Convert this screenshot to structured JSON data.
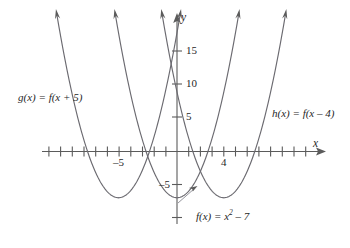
{
  "figure": {
    "type": "graph"
  },
  "axes": {
    "x_label": "x",
    "y_label": "y",
    "origin_px": [
      177,
      151.5
    ],
    "x_unit_px": 11.7,
    "y_unit_px": 6.6,
    "x_tick_labels": [
      {
        "value": -5,
        "text": "–5"
      },
      {
        "value": 4,
        "text": "4"
      }
    ],
    "y_tick_labels": [
      {
        "value": 15,
        "text": "15"
      },
      {
        "value": 10,
        "text": "10"
      },
      {
        "value": 5,
        "text": "5"
      },
      {
        "value": -5,
        "text": "–5"
      }
    ],
    "x_tick_values": [
      -11,
      -10,
      -9,
      -8,
      -7,
      -6,
      -5,
      -4,
      -3,
      -2,
      -1,
      1,
      2,
      3,
      4,
      5,
      6,
      7,
      8
    ],
    "y_tick_values": [
      15,
      10,
      5,
      -5,
      -10
    ]
  },
  "chart_data": {
    "type": "line",
    "title": "",
    "xlabel": "x",
    "ylabel": "y",
    "xlim": [
      -12.5,
      9.5
    ],
    "ylim": [
      -12,
      20
    ],
    "grid": false,
    "legend": "inline-annotations",
    "series": [
      {
        "name": "f(x) = x² – 7",
        "expression": "x^2-7",
        "vertex": [
          0,
          -7
        ],
        "x_range": [
          -5,
          5
        ]
      },
      {
        "name": "g(x) = f(x + 5)",
        "expression": "(x+5)^2-7",
        "vertex": [
          -5,
          -7
        ],
        "x_range": [
          -10,
          0
        ]
      },
      {
        "name": "h(x) = f(x – 4)",
        "expression": "(x-4)^2-7",
        "vertex": [
          4,
          -7
        ],
        "x_range": [
          -1,
          9
        ]
      }
    ]
  },
  "annotations": {
    "g_label": "g(x) = f(x + 5)",
    "h_label": "h(x) = f(x – 4)",
    "f_label_prefix": "f(x) = x",
    "f_label_exponent": "2",
    "f_label_suffix": " – 7"
  },
  "colors": {
    "curve": "#6b6a70",
    "axis": "#5b5b5b",
    "text": "#1f1f1f",
    "pointer": "#8a8a92",
    "background": "#ffffff"
  }
}
